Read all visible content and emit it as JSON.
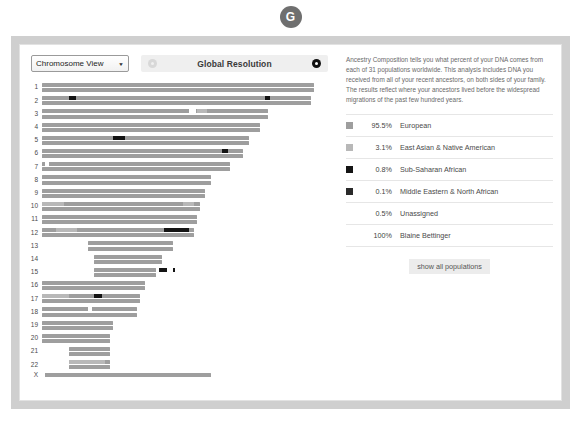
{
  "badge": {
    "letter": "G",
    "name": "g-badge"
  },
  "toolbar": {
    "view_select": {
      "value": "Chromosome View",
      "caret": "▼"
    },
    "zoom_out_label": "zoom-out",
    "zoom_in_label": "zoom-in",
    "resolution_title": "Global Resolution"
  },
  "intro": {
    "text": "Ancestry Composition tells you what percent of your DNA comes from each of 31 populations worldwide. This analysis includes DNA you received from all of your recent ancestors, on both sides of your family. The results reflect where your ancestors lived before the widespread migrations of the past few hundred years."
  },
  "legend": {
    "rows": [
      {
        "swatch": "#9e9e9e",
        "has_swatch": true,
        "percent": "95.5%",
        "name": "European"
      },
      {
        "swatch": "#b8b8b8",
        "has_swatch": true,
        "percent": "3.1%",
        "name": "East Asian & Native American"
      },
      {
        "swatch": "#141414",
        "has_swatch": true,
        "percent": "0.8%",
        "name": "Sub-Saharan African"
      },
      {
        "swatch": "#2a2a2a",
        "has_swatch": true,
        "percent": "0.1%",
        "name": "Middle Eastern & North African"
      },
      {
        "swatch": "",
        "has_swatch": false,
        "percent": "0.5%",
        "name": "Unassigned"
      },
      {
        "swatch": "",
        "has_swatch": false,
        "percent": "100%",
        "name": "Blaine Bettinger"
      }
    ],
    "show_all_label": "show all populations"
  },
  "chart_data": {
    "type": "bar",
    "xlabel": "",
    "ylabel": "Chromosome",
    "grid": false,
    "legend_position": "right",
    "colors": {
      "european": "#9e9e9e",
      "east_asian_native_american": "#b8b8b8",
      "sub_saharan_african": "#141414",
      "middle_eastern_north_african": "#2a2a2a",
      "unassigned": "#ffffff"
    },
    "categories": [
      "1",
      "2",
      "3",
      "4",
      "5",
      "6",
      "7",
      "8",
      "9",
      "10",
      "11",
      "12",
      "13",
      "14",
      "15",
      "16",
      "17",
      "18",
      "19",
      "20",
      "21",
      "22",
      "X"
    ],
    "values": [
      100,
      99,
      83,
      80,
      76,
      74,
      69,
      62,
      60,
      58,
      57,
      56,
      48,
      44,
      42,
      38,
      36,
      35,
      26,
      25,
      19,
      19,
      62
    ],
    "rows": [
      {
        "label": "1",
        "copies": 2,
        "start": 0,
        "length": 100,
        "segments": []
      },
      {
        "label": "2",
        "copies": 2,
        "start": 0,
        "length": 99,
        "segments": [
          {
            "pop": "sub_saharan_african",
            "copy": 0,
            "start": 10,
            "length": 2.5
          },
          {
            "pop": "sub_saharan_african",
            "copy": 0,
            "start": 82,
            "length": 2.0
          }
        ]
      },
      {
        "label": "3",
        "copies": 2,
        "start": 0,
        "length": 83,
        "segments": [
          {
            "pop": "east_asian_native_american",
            "copy": 0,
            "start": 57,
            "length": 3.5
          },
          {
            "pop": "unassigned",
            "copy": 0,
            "start": 54,
            "length": 2.5
          }
        ]
      },
      {
        "label": "4",
        "copies": 2,
        "start": 0,
        "length": 80,
        "segments": []
      },
      {
        "label": "5",
        "copies": 2,
        "start": 0,
        "length": 76,
        "segments": [
          {
            "pop": "sub_saharan_african",
            "copy": 0,
            "start": 26,
            "length": 4.5
          }
        ]
      },
      {
        "label": "6",
        "copies": 2,
        "start": 0,
        "length": 74,
        "segments": [
          {
            "pop": "sub_saharan_african",
            "copy": 0,
            "start": 66,
            "length": 2.5
          }
        ]
      },
      {
        "label": "7",
        "copies": 2,
        "start": 0,
        "length": 69,
        "segments": [
          {
            "pop": "unassigned",
            "copy": 0,
            "start": 1,
            "length": 1.5
          }
        ]
      },
      {
        "label": "8",
        "copies": 2,
        "start": 0,
        "length": 62,
        "segments": []
      },
      {
        "label": "9",
        "copies": 2,
        "start": 0,
        "length": 60,
        "segments": []
      },
      {
        "label": "10",
        "copies": 2,
        "start": 0,
        "length": 58,
        "segments": [
          {
            "pop": "east_asian_native_american",
            "copy": 0,
            "start": 0,
            "length": 8
          },
          {
            "pop": "east_asian_native_american",
            "copy": 0,
            "start": 52,
            "length": 4
          }
        ]
      },
      {
        "label": "11",
        "copies": 2,
        "start": 0,
        "length": 57,
        "segments": []
      },
      {
        "label": "12",
        "copies": 2,
        "start": 0,
        "length": 56,
        "segments": [
          {
            "pop": "east_asian_native_american",
            "copy": 0,
            "start": 5,
            "length": 8
          },
          {
            "pop": "sub_saharan_african",
            "copy": 0,
            "start": 45,
            "length": 9
          }
        ]
      },
      {
        "label": "13",
        "copies": 2,
        "start": 17,
        "length": 31,
        "segments": []
      },
      {
        "label": "14",
        "copies": 2,
        "start": 19,
        "length": 25,
        "segments": []
      },
      {
        "label": "15",
        "copies": 2,
        "start": 19,
        "length": 23,
        "segments": [
          {
            "pop": "sub_saharan_african",
            "copy": 0,
            "start": 24,
            "length": 3
          },
          {
            "pop": "sub_saharan_african",
            "copy": 0,
            "start": 29,
            "length": 1
          }
        ]
      },
      {
        "label": "16",
        "copies": 2,
        "start": 0,
        "length": 38,
        "segments": []
      },
      {
        "label": "17",
        "copies": 2,
        "start": 0,
        "length": 36,
        "segments": [
          {
            "pop": "east_asian_native_american",
            "copy": 0,
            "start": 0,
            "length": 10
          },
          {
            "pop": "sub_saharan_african",
            "copy": 0,
            "start": 19,
            "length": 3
          }
        ]
      },
      {
        "label": "18",
        "copies": 2,
        "start": 0,
        "length": 35,
        "segments": [
          {
            "pop": "unassigned",
            "copy": 0,
            "start": 17,
            "length": 1.5
          }
        ]
      },
      {
        "label": "19",
        "copies": 2,
        "start": 0,
        "length": 26,
        "segments": []
      },
      {
        "label": "20",
        "copies": 2,
        "start": 0,
        "length": 25,
        "segments": []
      },
      {
        "label": "21",
        "copies": 2,
        "start": 10,
        "length": 15,
        "segments": []
      },
      {
        "label": "22",
        "copies": 2,
        "start": 10,
        "length": 15,
        "segments": [
          {
            "pop": "east_asian_native_american",
            "copy": 0,
            "start": 0,
            "length": 13
          }
        ]
      },
      {
        "label": "X",
        "copies": 1,
        "start": 0,
        "length": 62,
        "segments": [
          {
            "pop": "unassigned",
            "copy": 0,
            "start": 0,
            "length": 1
          }
        ]
      }
    ]
  }
}
